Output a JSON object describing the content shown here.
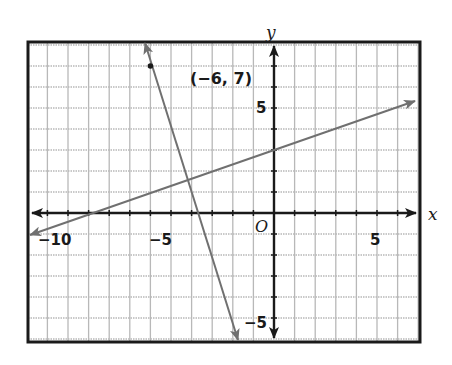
{
  "chart_data": {
    "type": "line",
    "title": "",
    "xlabel": "x",
    "ylabel": "y",
    "origin_label": "O",
    "xlim": [
      -12,
      7
    ],
    "ylim": [
      -6,
      8
    ],
    "grid": true,
    "x_tick_labels": [
      {
        "value": -10,
        "label": "−10"
      },
      {
        "value": -5,
        "label": "−5"
      },
      {
        "value": 5,
        "label": "5"
      }
    ],
    "y_tick_labels": [
      {
        "value": 5,
        "label": "5"
      },
      {
        "value": -5,
        "label": "−5"
      }
    ],
    "series": [
      {
        "name": "steep line",
        "equation": "y = -3x - 11",
        "slope": -3,
        "intercept": -11,
        "color": "#707070",
        "arrows": "both"
      },
      {
        "name": "shallow line",
        "equation": "y = x/3 + 3",
        "slope": 0.3333,
        "intercept": 3,
        "color": "#707070",
        "arrows": "both"
      }
    ],
    "points": [
      {
        "x": -6,
        "y": 7,
        "label": "(−6, 7)"
      }
    ],
    "annotations": [
      "(−6, 7)"
    ]
  },
  "colors": {
    "frame": "#1a1a1a",
    "grid": "#b8b8b8",
    "axis": "#1a1a1a",
    "line": "#707070"
  }
}
